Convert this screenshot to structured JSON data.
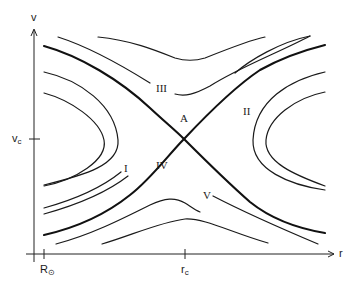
{
  "figure": {
    "type": "phase-portrait",
    "axes": {
      "x_label": "r",
      "y_label": "v",
      "x_ticks": [
        {
          "label": "R",
          "subscript": "⊙",
          "position": "near origin"
        },
        {
          "label": "r",
          "subscript": "c",
          "position": "critical radius"
        }
      ],
      "y_ticks": [
        {
          "label": "v",
          "subscript": "c",
          "position": "critical velocity"
        }
      ]
    },
    "critical_point_label": "A",
    "region_labels": [
      "I",
      "II",
      "III",
      "IV",
      "V"
    ],
    "colors": {
      "line": "#1a1a1a",
      "background": "#ffffff"
    }
  },
  "labels": {
    "y_axis": "v",
    "x_axis": "r",
    "vc_main": "v",
    "vc_sub": "c",
    "rsun_main": "R",
    "rsun_sub": "⊙",
    "rc_main": "r",
    "rc_sub": "c",
    "A": "A",
    "I": "I",
    "II": "II",
    "III": "III",
    "IV": "IV",
    "V": "V"
  }
}
